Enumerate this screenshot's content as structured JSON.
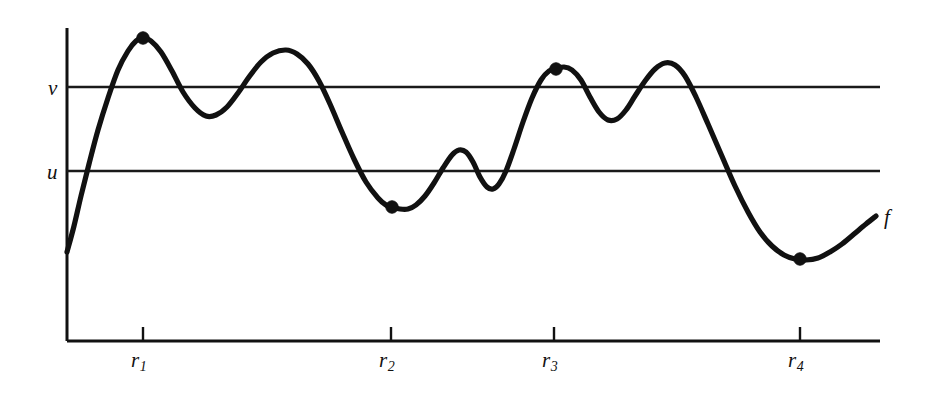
{
  "figure": {
    "kind": "mathematical-function-graph",
    "background_color": "#ffffff",
    "ink_color": "#111111"
  },
  "labels": {
    "level_v": "v",
    "level_u": "u",
    "curve": "f",
    "ticks": [
      {
        "base": "r",
        "sub": "1"
      },
      {
        "base": "r",
        "sub": "2"
      },
      {
        "base": "r",
        "sub": "3"
      },
      {
        "base": "r",
        "sub": "4"
      }
    ]
  },
  "chart_data": {
    "type": "line",
    "title": "",
    "xlabel": "",
    "ylabel": "",
    "grid": false,
    "legend": null,
    "axis": {
      "y_axis_x": 67,
      "y_axis_top": 28,
      "y_axis_bottom": 341,
      "x_axis_y": 341,
      "x_axis_left": 67,
      "x_axis_right": 880
    },
    "levels": [
      {
        "name": "v",
        "y_px": 87,
        "x_start": 67,
        "x_end": 880,
        "label_x": 48,
        "label_y": 78
      },
      {
        "name": "u",
        "y_px": 171,
        "x_start": 67,
        "x_end": 880,
        "label_x": 47,
        "label_y": 162
      }
    ],
    "ticks": [
      {
        "name": "r1",
        "x_px": 143,
        "label_x": 131,
        "label_y": 350
      },
      {
        "name": "r2",
        "x_px": 391,
        "label_x": 379,
        "label_y": 350
      },
      {
        "name": "r3",
        "x_px": 554,
        "label_x": 542,
        "label_y": 350
      },
      {
        "name": "r4",
        "x_px": 800,
        "label_x": 788,
        "label_y": 350
      }
    ],
    "markers": [
      {
        "name": "marker-r1",
        "x_px": 143,
        "y_px": 38,
        "radius": 6.2
      },
      {
        "name": "marker-r2",
        "x_px": 392,
        "y_px": 207,
        "radius": 6.2
      },
      {
        "name": "marker-r3",
        "x_px": 556,
        "y_px": 69,
        "radius": 6.2
      },
      {
        "name": "marker-r4",
        "x_px": 800,
        "y_px": 259,
        "radius": 6.2
      }
    ],
    "curve_label": {
      "text": "f",
      "x_px": 884,
      "y_px": 207
    },
    "curve_points": [
      [
        67,
        252
      ],
      [
        74,
        226
      ],
      [
        81,
        196
      ],
      [
        89,
        164
      ],
      [
        98,
        130
      ],
      [
        108,
        98
      ],
      [
        118,
        70
      ],
      [
        128,
        51
      ],
      [
        136,
        41
      ],
      [
        143,
        38
      ],
      [
        151,
        41
      ],
      [
        161,
        52
      ],
      [
        172,
        71
      ],
      [
        183,
        92
      ],
      [
        195,
        108
      ],
      [
        206,
        116
      ],
      [
        216,
        115
      ],
      [
        227,
        107
      ],
      [
        238,
        93
      ],
      [
        249,
        77
      ],
      [
        261,
        62
      ],
      [
        273,
        53
      ],
      [
        286,
        50
      ],
      [
        297,
        54
      ],
      [
        308,
        64
      ],
      [
        319,
        81
      ],
      [
        330,
        104
      ],
      [
        342,
        132
      ],
      [
        354,
        159
      ],
      [
        366,
        182
      ],
      [
        378,
        198
      ],
      [
        386,
        205
      ],
      [
        392,
        207
      ],
      [
        400,
        209
      ],
      [
        408,
        209
      ],
      [
        416,
        205
      ],
      [
        425,
        196
      ],
      [
        434,
        183
      ],
      [
        443,
        168
      ],
      [
        452,
        155
      ],
      [
        459,
        150
      ],
      [
        466,
        152
      ],
      [
        473,
        162
      ],
      [
        480,
        177
      ],
      [
        487,
        187
      ],
      [
        493,
        189
      ],
      [
        499,
        184
      ],
      [
        506,
        171
      ],
      [
        514,
        149
      ],
      [
        523,
        122
      ],
      [
        532,
        98
      ],
      [
        541,
        80
      ],
      [
        549,
        71
      ],
      [
        556,
        69
      ],
      [
        564,
        67
      ],
      [
        572,
        70
      ],
      [
        581,
        80
      ],
      [
        590,
        97
      ],
      [
        599,
        112
      ],
      [
        608,
        120
      ],
      [
        617,
        119
      ],
      [
        626,
        110
      ],
      [
        635,
        96
      ],
      [
        645,
        81
      ],
      [
        655,
        69
      ],
      [
        665,
        63
      ],
      [
        675,
        65
      ],
      [
        685,
        76
      ],
      [
        696,
        97
      ],
      [
        708,
        124
      ],
      [
        721,
        154
      ],
      [
        735,
        186
      ],
      [
        748,
        212
      ],
      [
        760,
        232
      ],
      [
        772,
        246
      ],
      [
        784,
        255
      ],
      [
        795,
        259
      ],
      [
        806,
        260
      ],
      [
        818,
        258
      ],
      [
        830,
        252
      ],
      [
        842,
        244
      ],
      [
        854,
        234
      ],
      [
        866,
        224
      ],
      [
        876,
        216
      ]
    ]
  }
}
